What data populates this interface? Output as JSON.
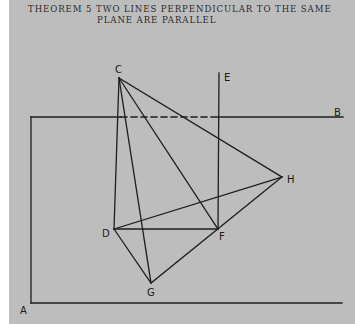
{
  "title": {
    "line1": "THEOREM 5  TWO LINES PERPENDICULAR TO THE SAME",
    "line2": "PLANE ARE PARALLEL"
  },
  "colors": {
    "background": "#bdbdbd",
    "line": "#1e1e1e",
    "margin": "#ffffff"
  },
  "diagram": {
    "points": {
      "A": {
        "label": "A",
        "x": 23,
        "y": 314
      },
      "B": {
        "label": "B",
        "x": 336,
        "y": 115
      },
      "C": {
        "label": "C",
        "x": 116,
        "y": 72
      },
      "D": {
        "label": "D",
        "x": 103,
        "y": 237
      },
      "E": {
        "label": "E",
        "x": 225,
        "y": 80
      },
      "F": {
        "label": "F",
        "x": 219,
        "y": 240
      },
      "G": {
        "label": "G",
        "x": 147,
        "y": 296
      },
      "H": {
        "label": "H",
        "x": 288,
        "y": 183
      }
    }
  }
}
